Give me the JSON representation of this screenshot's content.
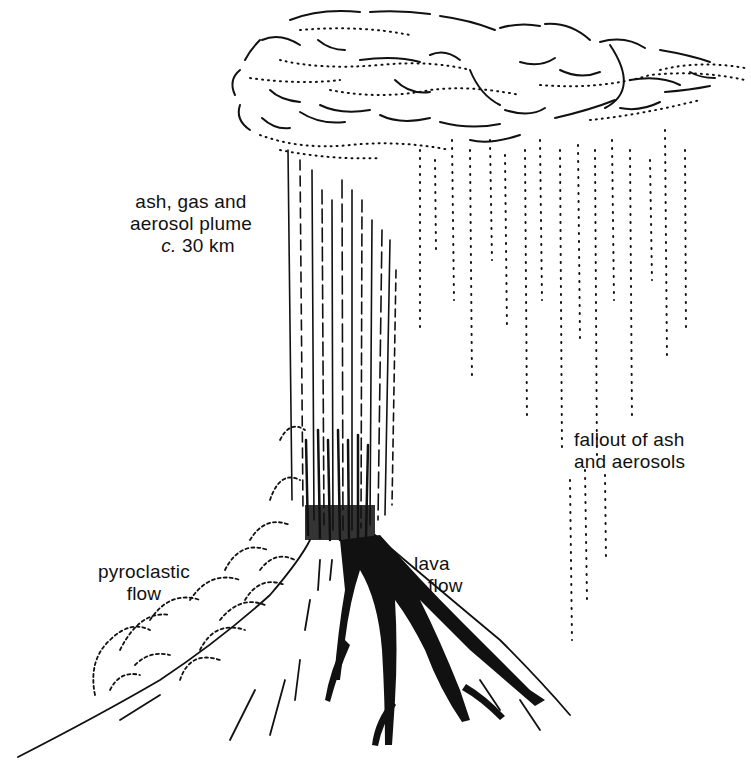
{
  "diagram": {
    "colors": {
      "ink": "#111111",
      "background": "#ffffff"
    },
    "labels": {
      "plume": {
        "line1": "ash, gas and",
        "line2": "aerosol plume",
        "height_prefix": "c.",
        "height_value": "30 km"
      },
      "fallout": {
        "line1": "fallout of ash",
        "line2": "and aerosols"
      },
      "pyroclastic": {
        "line1": "pyroclastic",
        "line2": "flow"
      },
      "lava": {
        "line1": "lava",
        "line2": "flow"
      }
    },
    "elements": [
      "eruption-cloud",
      "plume-column",
      "ash-fallout",
      "volcano-cone",
      "pyroclastic-flow",
      "lava-flow"
    ]
  }
}
